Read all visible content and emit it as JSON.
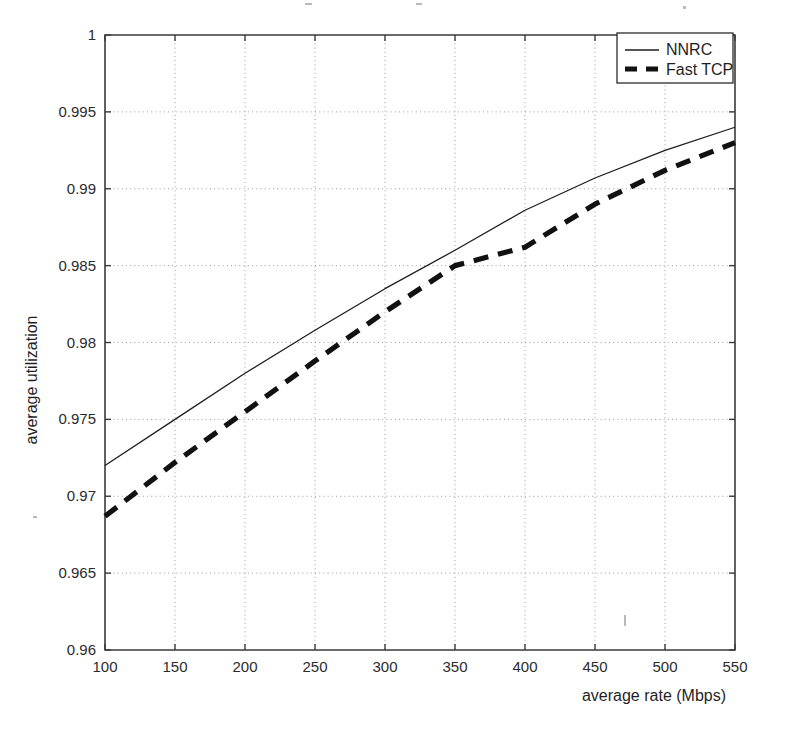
{
  "chart_data": {
    "type": "line",
    "title": "",
    "subtitle": "",
    "xlabel": "average rate (Mbps)",
    "ylabel": "average utilization",
    "xlim": [
      100,
      550
    ],
    "ylim": [
      0.96,
      1
    ],
    "xticks": [
      100,
      150,
      200,
      250,
      300,
      350,
      400,
      450,
      500,
      550
    ],
    "xtick_labels": [
      "100",
      "150",
      "200",
      "250",
      "300",
      "350",
      "400",
      "450",
      "500",
      "550"
    ],
    "yticks": [
      0.96,
      0.965,
      0.97,
      0.975,
      0.98,
      0.985,
      0.99,
      0.995,
      1
    ],
    "ytick_labels": [
      "0.96",
      "0.965",
      "0.97",
      "0.975",
      "0.98",
      "0.985",
      "0.99",
      "0.995",
      "1"
    ],
    "grid": true,
    "grid_style": "dotted",
    "legend_position": "top-right",
    "x": [
      100,
      150,
      200,
      250,
      300,
      350,
      400,
      450,
      500,
      550
    ],
    "series": [
      {
        "name": "NNRC",
        "style": "solid",
        "color": "#1d1d1d",
        "line_width": 1.3,
        "values": [
          0.972,
          0.975,
          0.978,
          0.9808,
          0.9835,
          0.986,
          0.9886,
          0.9907,
          0.9925,
          0.994
        ]
      },
      {
        "name": "Fast TCP",
        "style": "dashed",
        "color": "#111111",
        "line_width": 5.2,
        "values": [
          0.9687,
          0.9722,
          0.9755,
          0.9788,
          0.982,
          0.985,
          0.9862,
          0.989,
          0.9912,
          0.993
        ]
      }
    ]
  },
  "legend": {
    "entries": [
      {
        "label": "NNRC",
        "swatch": "solid-line-swatch"
      },
      {
        "label": "Fast TCP",
        "swatch": "dashed-line-swatch"
      }
    ]
  },
  "axes": {
    "x_title": "average rate (Mbps)",
    "y_title": "average utilization"
  }
}
